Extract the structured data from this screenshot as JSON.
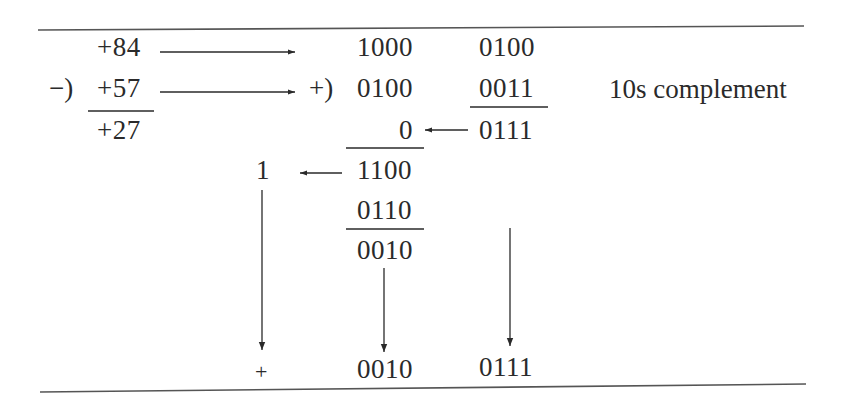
{
  "diagram": {
    "decimal": {
      "minuend": "+84",
      "operator": "−)",
      "subtrahend": "+57",
      "result": "+27"
    },
    "bcd": {
      "addition_operator": "+)",
      "high_digit": {
        "row1": "1000",
        "row2": "0100",
        "carry_in": "0",
        "sum": "1100",
        "correction": "0110",
        "corrected": "0010"
      },
      "low_digit": {
        "row1": "0100",
        "row2": "0011",
        "sum": "0111"
      },
      "carry_out": "1",
      "complement_label": "10s complement"
    },
    "result": {
      "sign": "+",
      "high": "0010",
      "low": "0111"
    },
    "colors": {
      "ink": "#2a2a2a",
      "background": "#ffffff"
    }
  }
}
